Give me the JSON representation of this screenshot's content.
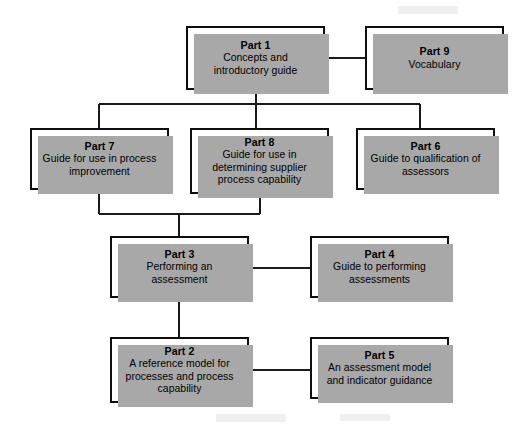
{
  "diagram": {
    "type": "hierarchy-block-diagram",
    "background_color": "#ffffff",
    "box_border_color": "#0d0d0d",
    "box_fill_color": "#ffffff",
    "box_shadow_color": "#a8a8a8",
    "connector_color": "#1a1a1a",
    "nodes": [
      {
        "id": "part1",
        "title": "Part 1",
        "description": "Concepts and\nintroductory guide",
        "x": 186,
        "y": 26,
        "w": 139,
        "h": 64
      },
      {
        "id": "part9",
        "title": "Part 9",
        "description": "Vocabulary",
        "x": 365,
        "y": 26,
        "w": 139,
        "h": 64
      },
      {
        "id": "part7",
        "title": "Part 7",
        "description": "Guide for use in process\nimprovement",
        "x": 30,
        "y": 128,
        "w": 139,
        "h": 62
      },
      {
        "id": "part8",
        "title": "Part 8",
        "description": "Guide for use in\ndetermining supplier\nprocess capability",
        "x": 190,
        "y": 128,
        "w": 139,
        "h": 66
      },
      {
        "id": "part6",
        "title": "Part 6",
        "description": "Guide to qualification of\nassessors",
        "x": 356,
        "y": 128,
        "w": 139,
        "h": 62
      },
      {
        "id": "part3",
        "title": "Part 3",
        "description": "Performing an\nassessment",
        "x": 110,
        "y": 236,
        "w": 139,
        "h": 62
      },
      {
        "id": "part4",
        "title": "Part 4",
        "description": "Guide to performing\nassessments",
        "x": 310,
        "y": 236,
        "w": 139,
        "h": 62
      },
      {
        "id": "part2",
        "title": "Part 2",
        "description": "A reference model for\nprocesses and process\ncapability",
        "x": 110,
        "y": 337,
        "w": 139,
        "h": 66
      },
      {
        "id": "part5",
        "title": "Part 5",
        "description": "An assessment model\nand indicator guidance",
        "x": 310,
        "y": 337,
        "w": 139,
        "h": 62
      }
    ],
    "connectors": [
      {
        "id": "part1-to-part9",
        "from": "part1",
        "to": "part9",
        "style": "horizontal"
      },
      {
        "id": "part1-to-bus",
        "from": "part1",
        "to": "distribution-bus",
        "style": "vertical"
      },
      {
        "id": "bus-to-part7",
        "from": "distribution-bus",
        "to": "part7",
        "style": "elbow"
      },
      {
        "id": "bus-to-part8",
        "from": "distribution-bus",
        "to": "part8",
        "style": "vertical"
      },
      {
        "id": "bus-to-part6",
        "from": "distribution-bus",
        "to": "part6",
        "style": "elbow"
      },
      {
        "id": "part7-to-merge",
        "from": "part7",
        "to": "merge-bus",
        "style": "elbow"
      },
      {
        "id": "part8-to-merge",
        "from": "part8",
        "to": "merge-bus",
        "style": "elbow"
      },
      {
        "id": "merge-to-part3",
        "from": "merge-bus",
        "to": "part3",
        "style": "vertical"
      },
      {
        "id": "part3-to-part4",
        "from": "part3",
        "to": "part4",
        "style": "horizontal"
      },
      {
        "id": "part3-to-part2",
        "from": "part3",
        "to": "part2",
        "style": "vertical"
      },
      {
        "id": "part2-to-part5",
        "from": "part2",
        "to": "part5",
        "style": "horizontal"
      }
    ]
  }
}
